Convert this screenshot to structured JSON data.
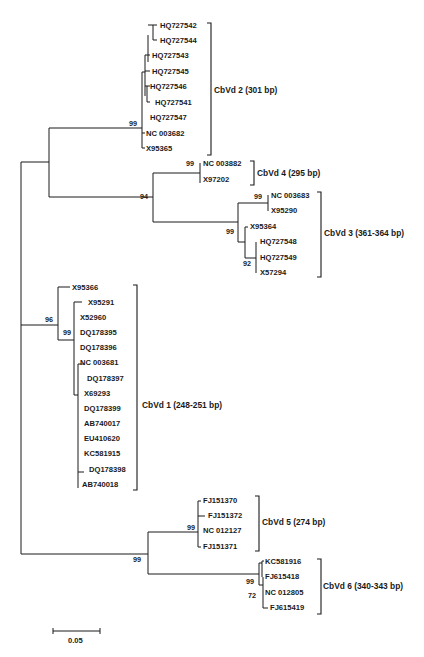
{
  "figure": {
    "type": "phylogenetic-tree",
    "scale_bar": {
      "label": "0.05"
    },
    "clades": [
      {
        "id": "cbvd2",
        "label": "CbVd 2 (301 bp)",
        "bootstrap": "99",
        "leaves": [
          "HQ727542",
          "HQ727544",
          "HQ727543",
          "HQ727545",
          "HQ727546",
          "HQ727541",
          "HQ727547",
          "NC 003682",
          "X95365"
        ]
      },
      {
        "id": "cbvd4",
        "label": "CbVd 4 (295 bp)",
        "bootstrap": "99",
        "leaves": [
          "NC 003882",
          "X97202"
        ]
      },
      {
        "id": "cbvd3",
        "label": "CbVd 3 (361-364 bp)",
        "bootstrap": "99",
        "leaves": [
          "NC 003683",
          "X95290",
          "X95364",
          "HQ727548",
          "HQ727549",
          "X57294"
        ],
        "inner_bootstraps": [
          "99",
          "99",
          "92"
        ]
      },
      {
        "id": "cbvd1",
        "label": "CbVd 1 (248-251 bp)",
        "bootstrap": "96",
        "leaves": [
          "X95366",
          "X95291",
          "X52960",
          "DQ178395",
          "DQ178396",
          "NC 003681",
          "DQ178397",
          "X69293",
          "DQ178399",
          "AB740017",
          "EU410620",
          "KC581915",
          "DQ178398",
          "AB740018"
        ],
        "inner_bootstraps": [
          "99"
        ]
      },
      {
        "id": "cbvd5",
        "label": "CbVd 5 (274 bp)",
        "bootstrap": "99",
        "leaves": [
          "FJ151370",
          "FJ151372",
          "NC 012127",
          "FJ151371"
        ]
      },
      {
        "id": "cbvd6",
        "label": "CbVd 6 (340-343 bp)",
        "bootstrap": "99",
        "leaves": [
          "KC581916",
          "FJ615418",
          "NC 012805",
          "FJ615419"
        ],
        "inner_bootstraps": [
          "72"
        ]
      }
    ],
    "internal_bootstraps": {
      "cbvd2_34_4": "94",
      "cbvd5_6": "99"
    }
  }
}
